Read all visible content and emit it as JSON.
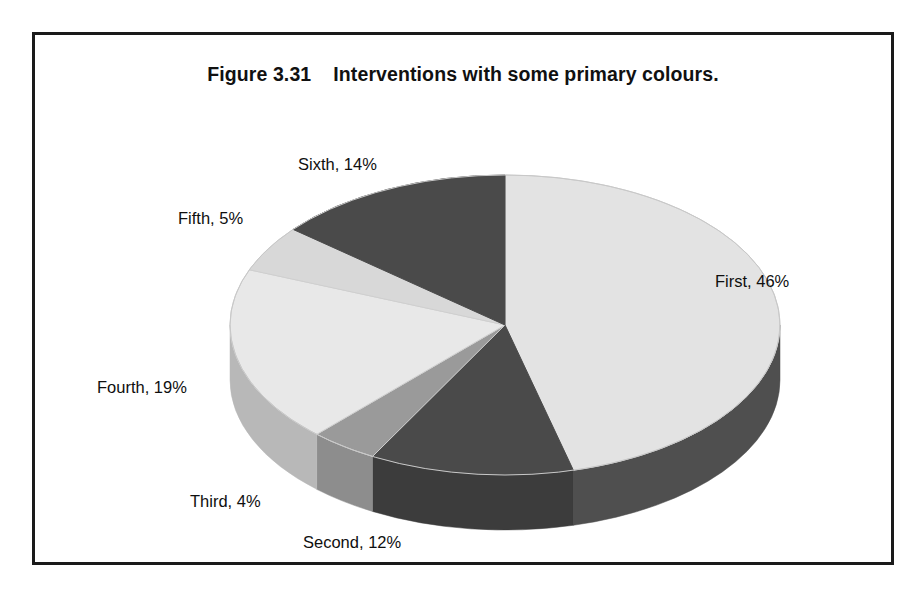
{
  "figure": {
    "title": "Figure 3.31    Interventions with some primary colours."
  },
  "labels": {
    "first": "First, 46%",
    "second": "Second, 12%",
    "third": "Third, 4%",
    "fourth": "Fourth, 19%",
    "fifth": "Fifth, 5%",
    "sixth": "Sixth, 14%"
  },
  "chart_data": {
    "type": "pie",
    "title": "Figure 3.31    Interventions with some primary colours.",
    "xlabel": "",
    "ylabel": "",
    "grid": false,
    "legend": "none",
    "labels_position": "outside",
    "three_d": true,
    "start_angle_deg": 90,
    "direction": "clockwise",
    "categories": [
      "First",
      "Second",
      "Third",
      "Fourth",
      "Fifth",
      "Sixth"
    ],
    "values": [
      46,
      12,
      4,
      19,
      5,
      14
    ],
    "units": "%",
    "data_labels": [
      "First, 46%",
      "Second, 12%",
      "Third, 4%",
      "Fourth, 19%",
      "Fifth, 5%",
      "Sixth, 14%"
    ],
    "slice_colors": {
      "First": "#e3e3e3",
      "Second": "#4a4a4a",
      "Third": "#9a9a9a",
      "Fourth": "#e8e8e8",
      "Fifth": "#d8d8d8",
      "Sixth": "#4a4a4a"
    },
    "side_colors": {
      "First": "#4f4f4f",
      "Second": "#3c3c3c",
      "Third": "#8d8d8d",
      "Fourth": "#b8b8b8",
      "Fifth": "#b0b0b0",
      "Sixth": "#3c3c3c"
    }
  },
  "colors": {
    "frame": "#1a1a1a",
    "background": "#ffffff",
    "text": "#111111",
    "top_light": "#e8e8e8",
    "top_dark": "#4a4a4a",
    "top_mid": "#9a9a9a",
    "side_light": "#b8b8b8",
    "side_dark": "#3c3c3c",
    "side_mid": "#8d8d8d",
    "edge": "#c2c2c2"
  }
}
